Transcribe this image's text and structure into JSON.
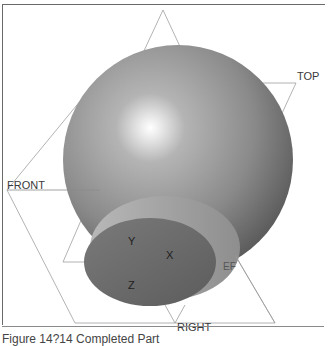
{
  "figure": {
    "planes": {
      "top_label": "TOP",
      "front_label": "FRONT",
      "right_label": "RIGHT",
      "hidden_label_partial": "EF",
      "top_hidden_label": "A_1"
    },
    "axes": {
      "x": "X",
      "y": "Y",
      "z": "Z"
    },
    "colors": {
      "sphere_light": "#c4c4c4",
      "sphere_mid": "#8c8c8c",
      "sphere_dark": "#555555",
      "disk_face": "#6f6f6f",
      "disk_rim": "#a8a8a8",
      "plane_line": "#9a9a9a"
    },
    "caption": "Figure 14?14 Completed Part"
  }
}
